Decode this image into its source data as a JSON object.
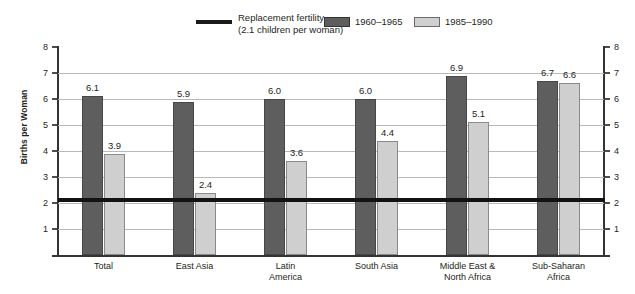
{
  "chart_data": {
    "type": "bar",
    "title": "",
    "xlabel": "",
    "ylabel": "Births per Woman",
    "ylim": [
      0,
      8.2
    ],
    "yticks": [
      1,
      2,
      3,
      4,
      5,
      6,
      7,
      8
    ],
    "grid": true,
    "legend_position": "top-right",
    "categories": [
      "Total",
      "East Asia",
      "Latin America",
      "South Asia",
      "Middle East & North Africa",
      "Sub-Saharan Africa"
    ],
    "category_lines": [
      [
        "Total"
      ],
      [
        "East Asia"
      ],
      [
        "Latin",
        "America"
      ],
      [
        "South Asia"
      ],
      [
        "Middle East &",
        "North Africa"
      ],
      [
        "Sub-Saharan",
        "Africa"
      ]
    ],
    "series": [
      {
        "name": "1960–1965",
        "color": "#5e5e5e",
        "values": [
          6.1,
          5.9,
          6.0,
          6.0,
          6.9,
          6.7
        ],
        "labels": [
          "6.1",
          "5.9",
          "6.0",
          "6.0",
          "6.9",
          "6.7"
        ]
      },
      {
        "name": "1985–1990",
        "color": "#cfcfcf",
        "values": [
          3.9,
          2.4,
          3.6,
          4.4,
          5.1,
          6.6
        ],
        "labels": [
          "3.9",
          "2.4",
          "3.6",
          "4.4",
          "5.1",
          "6.6"
        ]
      }
    ],
    "reference_line": {
      "label_line1": "Replacement fertility",
      "label_line2": "(2.1 children per woman)",
      "value": 2.1,
      "color": "#121212"
    }
  },
  "axis": {
    "y_title": "Births per Woman",
    "tick_labels": [
      "1",
      "2",
      "3",
      "4",
      "5",
      "6",
      "7",
      "8"
    ]
  },
  "legend": {
    "replacement_line1": "Replacement fertility",
    "replacement_line2": "(2.1 children per woman)",
    "series1_label": "1960–1965",
    "series2_label": "1985–1990"
  }
}
